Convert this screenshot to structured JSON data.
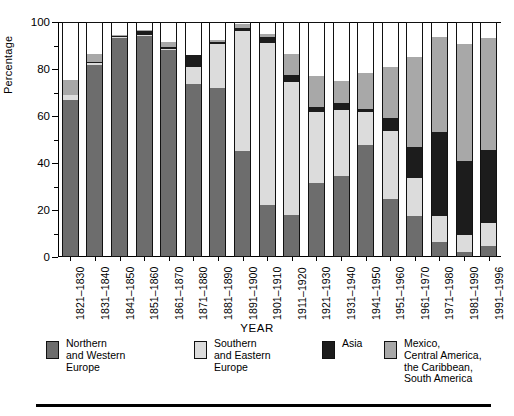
{
  "chart_data": {
    "type": "bar",
    "subtype": "stacked-bar-100",
    "title": "",
    "xlabel": "YEAR",
    "ylabel": "Percentage",
    "ylim": [
      0,
      100
    ],
    "yticks": [
      0,
      20,
      40,
      60,
      80,
      100
    ],
    "ytick_labels": [
      "0",
      "20",
      "40",
      "60",
      "80",
      "100"
    ],
    "minor_ticks": [
      10,
      30,
      50,
      70,
      90
    ],
    "grid": false,
    "legend_position": "bottom",
    "categories": [
      "1821-1830",
      "1831-1840",
      "1841-1850",
      "1851-1860",
      "1861-1870",
      "1871-1880",
      "1881-1890",
      "1891-1900",
      "1901-1910",
      "1911-1920",
      "1921-1930",
      "1931-1940",
      "1941-1950",
      "1951-1960",
      "1961-1970",
      "1971-1980",
      "1981-1990",
      "1991-1996"
    ],
    "series": [
      {
        "name": "Northern and Western Europe",
        "color": "#6d6d6d",
        "values": [
          67,
          81.5,
          93,
          94,
          88,
          73.5,
          72,
          45,
          22,
          18,
          31.5,
          34.5,
          47.5,
          24.5,
          17.5,
          6.5,
          2,
          4.5
        ]
      },
      {
        "name": "Southern and Eastern Europe",
        "color": "#dcdcdc",
        "values": [
          2,
          1,
          0.5,
          0.5,
          0.5,
          7.5,
          18.5,
          51,
          69,
          56.5,
          30,
          28,
          14,
          29,
          16,
          11,
          7.5,
          10
        ]
      },
      {
        "name": "Asia",
        "color": "#1c1c1c",
        "values": [
          0,
          0.5,
          0.5,
          1.5,
          1,
          5,
          1,
          1.5,
          2.5,
          3,
          2.5,
          3,
          1.5,
          5.5,
          13.5,
          35.5,
          31.5,
          31
        ]
      },
      {
        "name": "Mexico, Central America, the Caribbean, South America",
        "color": "#a8a8a8",
        "values": [
          6.5,
          3.5,
          0.5,
          0.5,
          2,
          0,
          1,
          1.5,
          1.5,
          9,
          13,
          9.5,
          15.5,
          22,
          38,
          40.5,
          49.5,
          47.5
        ]
      },
      {
        "name": "Other",
        "color": "#ffffff",
        "values": [
          24.5,
          13.5,
          5.5,
          3.5,
          8.5,
          14,
          7.5,
          1,
          5,
          13.5,
          23,
          25,
          21.5,
          19,
          15,
          6.5,
          9.5,
          7
        ]
      }
    ]
  },
  "axis": {
    "y_title": "Percentage",
    "x_title": "YEAR"
  },
  "legend": {
    "items": [
      {
        "label": "Northern\nand Western\nEurope",
        "color": "#6d6d6d",
        "swatch": "swatch-northern-western-europe"
      },
      {
        "label": "Southern\nand Eastern\nEurope",
        "color": "#dcdcdc",
        "swatch": "swatch-southern-eastern-europe"
      },
      {
        "label": "Asia",
        "color": "#1c1c1c",
        "swatch": "swatch-asia"
      },
      {
        "label": "Mexico,\nCentral America,\nthe Caribbean,\nSouth America",
        "color": "#a8a8a8",
        "swatch": "swatch-latin-america"
      },
      {
        "label": "Other",
        "color": "#ffffff",
        "swatch": "swatch-other"
      }
    ]
  }
}
